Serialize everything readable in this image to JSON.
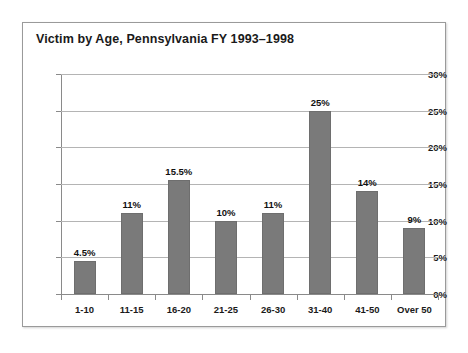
{
  "chart_data": {
    "type": "bar",
    "title": "Victim by Age, Pennsylvania FY 1993–1998",
    "xlabel": "",
    "ylabel": "",
    "categories": [
      "1-10",
      "11-15",
      "16-20",
      "21-25",
      "26-30",
      "31-40",
      "41-50",
      "Over 50"
    ],
    "values": [
      4.5,
      11,
      15.5,
      10,
      11,
      25,
      14,
      9
    ],
    "value_labels": [
      "4.5%",
      "11%",
      "15.5%",
      "10%",
      "11%",
      "25%",
      "14%",
      "9%"
    ],
    "ylim": [
      0,
      30
    ],
    "ytick_values": [
      0,
      5,
      10,
      15,
      20,
      25,
      30
    ],
    "ytick_labels": [
      "0%",
      "5%",
      "10%",
      "15%",
      "20%",
      "25%",
      "30%"
    ],
    "grid": true,
    "legend": false,
    "legend_position": "none",
    "series_name": "Victim by Age",
    "units": "percent"
  },
  "style": {
    "bar_color": "#7a7a7a",
    "bar_border_color": "#6e6e6e",
    "gridline_color": "#b4b4b4",
    "axis_color": "#8a8a8a",
    "text_color": "#1a1a1a",
    "frame_border_color": "#9a9a9a",
    "background_color": "#ffffff"
  }
}
